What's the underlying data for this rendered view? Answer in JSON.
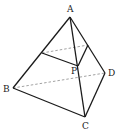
{
  "diagram": {
    "type": "tetrahedron",
    "vertices": {
      "A": {
        "label": "A",
        "x": 70,
        "y": 17
      },
      "B": {
        "label": "B",
        "x": 13,
        "y": 88
      },
      "C": {
        "label": "C",
        "x": 85,
        "y": 117
      },
      "D": {
        "label": "D",
        "x": 105,
        "y": 73
      },
      "P": {
        "label": "P",
        "x": 78,
        "y": 66
      },
      "E": {
        "x": 42,
        "y": 53
      },
      "F": {
        "x": 88,
        "y": 45
      }
    },
    "labels": {
      "A": "A",
      "B": "B",
      "C": "C",
      "D": "D",
      "P": "P"
    },
    "solid_edges": [
      [
        "A",
        "B"
      ],
      [
        "A",
        "C"
      ],
      [
        "A",
        "D"
      ],
      [
        "B",
        "C"
      ],
      [
        "C",
        "D"
      ],
      [
        "E",
        "P"
      ],
      [
        "P",
        "F"
      ]
    ],
    "hidden_edges": [
      [
        "B",
        "D"
      ],
      [
        "E",
        "F"
      ]
    ]
  }
}
